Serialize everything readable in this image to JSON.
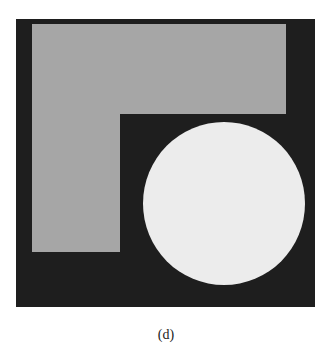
{
  "figure": {
    "caption": "(d)",
    "colors": {
      "background": "#1e1e1e",
      "l_shape": "#a6a6a6",
      "circle": "#ececec"
    }
  }
}
